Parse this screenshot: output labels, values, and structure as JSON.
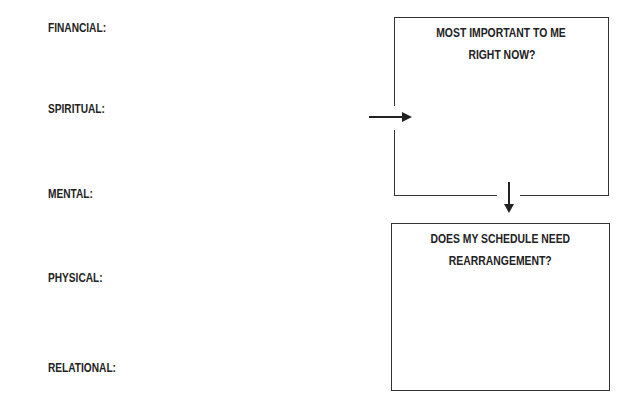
{
  "categories": [
    {
      "label": "FINANCIAL:"
    },
    {
      "label": "SPIRITUAL:"
    },
    {
      "label": "MENTAL:"
    },
    {
      "label": "PHYSICAL:"
    },
    {
      "label": "RELATIONAL:"
    }
  ],
  "boxes": [
    {
      "title_line1": "MOST IMPORTANT TO ME",
      "title_line2": "RIGHT NOW?"
    },
    {
      "title_line1": "DOES MY SCHEDULE NEED",
      "title_line2": "REARRANGEMENT?"
    }
  ],
  "colors": {
    "line": "#333333",
    "text": "#222222",
    "background": "#ffffff"
  }
}
